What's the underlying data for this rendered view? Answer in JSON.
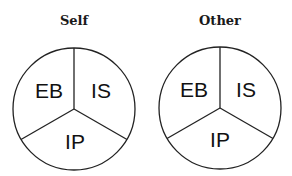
{
  "diagrams": [
    {
      "title": "Self",
      "segments": [
        {
          "label": "EB",
          "position": "upper-left"
        },
        {
          "label": "IS",
          "position": "upper-right"
        },
        {
          "label": "IP",
          "position": "bottom"
        }
      ]
    },
    {
      "title": "Other",
      "segments": [
        {
          "label": "EB",
          "position": "upper-left"
        },
        {
          "label": "IS",
          "position": "upper-right"
        },
        {
          "label": "IP",
          "position": "bottom"
        }
      ]
    }
  ],
  "colors": {
    "stroke": "#222222",
    "fill": "#ffffff",
    "text": "#111111"
  }
}
